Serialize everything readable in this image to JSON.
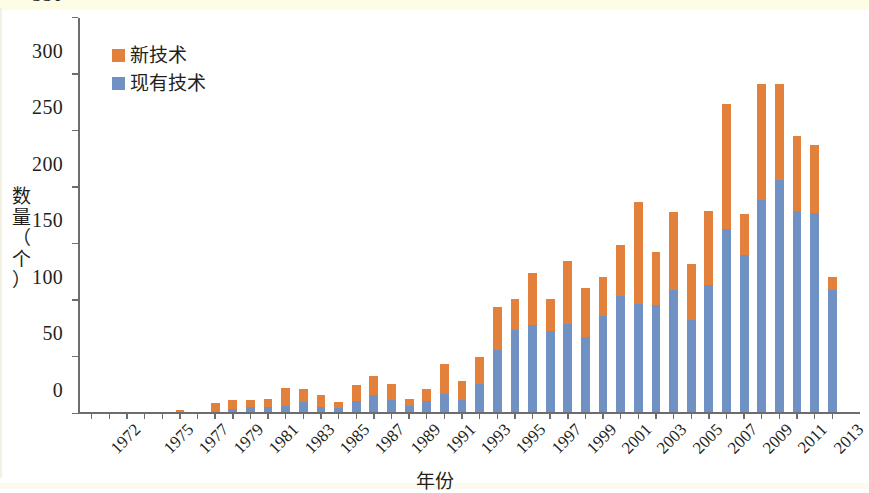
{
  "chart_data": {
    "type": "bar",
    "subtype": "stacked-vertical",
    "title": "",
    "xlabel": "年份",
    "ylabel": "数量（个）",
    "ylim": [
      0,
      350
    ],
    "ytick_values": [
      0,
      50,
      100,
      150,
      200,
      250,
      300,
      350
    ],
    "ytick_labels": [
      "0",
      "50",
      "100",
      "150",
      "200",
      "250",
      "300",
      "350"
    ],
    "grid": false,
    "legend_position": "upper-left",
    "x": [
      1972,
      1973,
      1974,
      1975,
      1976,
      1977,
      1978,
      1979,
      1980,
      1981,
      1982,
      1983,
      1984,
      1985,
      1986,
      1987,
      1988,
      1989,
      1990,
      1991,
      1992,
      1993,
      1994,
      1995,
      1996,
      1997,
      1998,
      1999,
      2000,
      2001,
      2002,
      2003,
      2004,
      2005,
      2006,
      2007,
      2008,
      2009,
      2010,
      2011,
      2012,
      2013,
      2014
    ],
    "xtick_labels": [
      "1972",
      "1975",
      "1977",
      "1979",
      "1981",
      "1983",
      "1985",
      "1987",
      "1989",
      "1991",
      "1993",
      "1995",
      "1997",
      "1999",
      "2001",
      "2003",
      "2005",
      "2007",
      "2009",
      "2011",
      "2013"
    ],
    "xtick_index": [
      0,
      3,
      5,
      7,
      9,
      11,
      13,
      15,
      17,
      19,
      21,
      23,
      25,
      27,
      29,
      31,
      33,
      35,
      37,
      39,
      41
    ],
    "series": [
      {
        "name": "现有技术",
        "color": "#6f91c4",
        "stack_order": 0,
        "values": [
          0,
          0,
          0,
          0,
          0,
          0,
          0,
          0,
          3,
          5,
          5,
          6,
          9,
          5,
          4,
          10,
          15,
          11,
          6,
          10,
          16,
          11,
          25,
          55,
          73,
          77,
          72,
          78,
          67,
          85,
          103,
          96,
          95,
          108,
          82,
          113,
          162,
          139,
          188,
          205,
          178,
          176,
          108
        ]
      },
      {
        "name": "新技术",
        "color": "#e2803c",
        "stack_order": 1,
        "values": [
          0,
          0,
          0,
          0,
          0,
          2,
          0,
          8,
          8,
          6,
          7,
          16,
          12,
          10,
          5,
          14,
          17,
          14,
          6,
          11,
          27,
          17,
          24,
          38,
          27,
          46,
          28,
          56,
          43,
          35,
          45,
          90,
          47,
          69,
          49,
          65,
          111,
          36,
          102,
          85,
          66,
          60,
          12
        ]
      }
    ],
    "totals": [
      0,
      0,
      0,
      0,
      0,
      2,
      0,
      8,
      11,
      11,
      12,
      22,
      21,
      15,
      9,
      24,
      32,
      25,
      12,
      21,
      43,
      28,
      49,
      93,
      100,
      123,
      100,
      134,
      110,
      120,
      148,
      186,
      142,
      177,
      131,
      178,
      273,
      175,
      290,
      290,
      244,
      236,
      120
    ]
  },
  "legend": {
    "items": [
      {
        "label": "新技术",
        "color": "#e2803c"
      },
      {
        "label": "现有技术",
        "color": "#6f91c4"
      }
    ]
  },
  "axes": {
    "y_title": "数量（个）",
    "y_title_chars": [
      "数",
      "量",
      "（",
      "个",
      "）"
    ],
    "x_title": "年份"
  },
  "colors": {
    "new_tech": "#e2803c",
    "existing_tech": "#6f91c4",
    "axis": "#6d6d6d",
    "text": "#231f1c",
    "background": "#ffffff",
    "band": "#fdfce4"
  }
}
